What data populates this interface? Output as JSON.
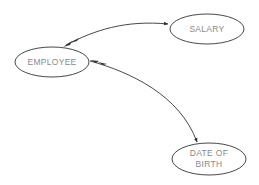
{
  "diagram": {
    "type": "entity-attribute",
    "colors": {
      "node_stroke": "#333333",
      "edge_stroke": "#333333",
      "label_text": "#8a8a8a",
      "background": "#ffffff"
    },
    "nodes": [
      {
        "id": "employee",
        "label": "EMPLOYEE",
        "shape": "ellipse"
      },
      {
        "id": "salary",
        "label": "SALARY",
        "shape": "ellipse"
      },
      {
        "id": "dob",
        "label": "DATE OF\nBIRTH",
        "shape": "ellipse"
      }
    ],
    "edges": [
      {
        "from": "employee",
        "to": "salary",
        "arrow_start": "double-arrow",
        "arrow_end": "arrow"
      },
      {
        "from": "employee",
        "to": "dob",
        "arrow_start": "double-arrow",
        "arrow_end": "arrow"
      }
    ]
  }
}
